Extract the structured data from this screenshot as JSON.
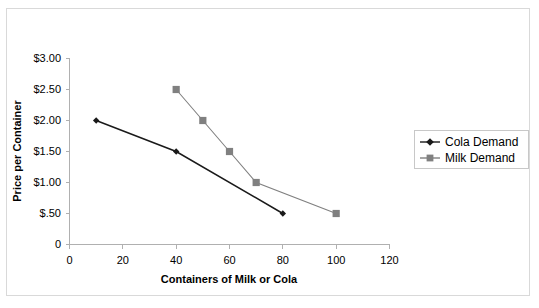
{
  "chart_data": {
    "type": "line",
    "title": "",
    "xlabel": "Containers of Milk or Cola",
    "ylabel": "Price per Container",
    "xlim": [
      0,
      120
    ],
    "ylim": [
      0,
      3.0
    ],
    "xticks": [
      "0",
      "20",
      "40",
      "60",
      "80",
      "100",
      "120"
    ],
    "xtick_values": [
      0,
      20,
      40,
      60,
      80,
      100,
      120
    ],
    "yticks": [
      "0",
      "$.50",
      "$1.00",
      "$1.50",
      "$2.00",
      "$2.50",
      "$3.00"
    ],
    "ytick_values": [
      0,
      0.5,
      1.0,
      1.5,
      2.0,
      2.5,
      3.0
    ],
    "grid": false,
    "legend_position": "right",
    "series": [
      {
        "name": "Cola Demand",
        "marker": "diamond",
        "color": "#1a1a1a",
        "points": [
          {
            "x": 10,
            "y": 2.0
          },
          {
            "x": 40,
            "y": 1.5
          },
          {
            "x": 80,
            "y": 0.5
          }
        ]
      },
      {
        "name": "Milk Demand",
        "marker": "square",
        "color": "#808080",
        "points": [
          {
            "x": 40,
            "y": 2.5
          },
          {
            "x": 50,
            "y": 2.0
          },
          {
            "x": 60,
            "y": 1.5
          },
          {
            "x": 70,
            "y": 1.0
          },
          {
            "x": 100,
            "y": 0.5
          }
        ]
      }
    ]
  },
  "legend": {
    "entries": [
      {
        "label": "Cola Demand"
      },
      {
        "label": "Milk Demand"
      }
    ]
  },
  "colors": {
    "cola": "#1a1a1a",
    "milk": "#808080",
    "axis": "#b0b0b0",
    "frame": "#d9d9d9"
  }
}
